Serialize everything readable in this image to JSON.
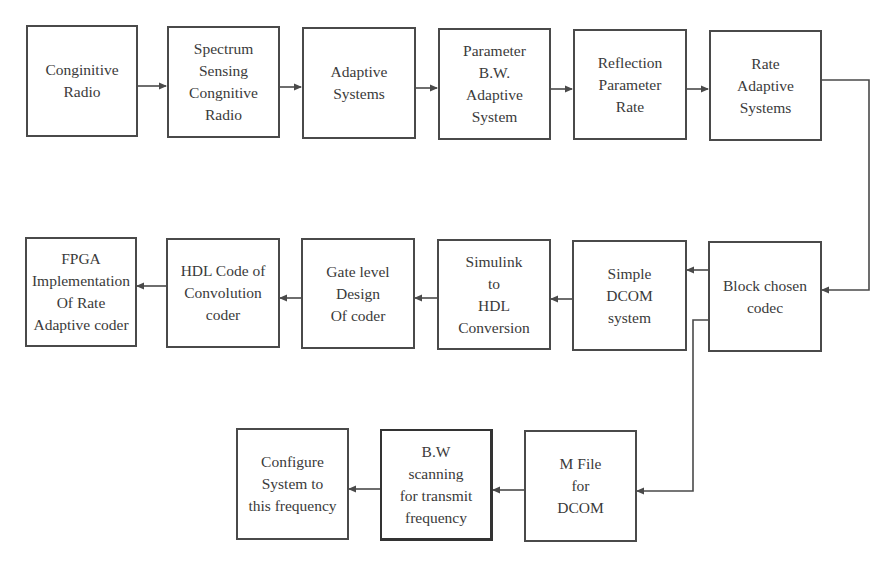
{
  "diagram": {
    "row1": [
      {
        "id": "cognitive-radio",
        "lines": [
          "Conginitive",
          "Radio"
        ]
      },
      {
        "id": "spectrum-sensing",
        "lines": [
          "Spectrum",
          "Sensing",
          "Congnitive",
          "Radio"
        ]
      },
      {
        "id": "adaptive-systems",
        "lines": [
          "Adaptive",
          "Systems"
        ]
      },
      {
        "id": "parameter-bw",
        "lines": [
          "Parameter",
          "B.W.",
          "Adaptive",
          "System"
        ]
      },
      {
        "id": "reflection-parameter",
        "lines": [
          "Reflection",
          "Parameter",
          "Rate"
        ]
      },
      {
        "id": "rate-adaptive",
        "lines": [
          "Rate",
          "Adaptive",
          "Systems"
        ]
      }
    ],
    "row2": [
      {
        "id": "fpga-implementation",
        "lines": [
          "FPGA",
          "Implementation",
          "Of Rate",
          "Adaptive coder"
        ]
      },
      {
        "id": "hdl-code",
        "lines": [
          "HDL Code of",
          "Convolution",
          "coder"
        ]
      },
      {
        "id": "gate-level",
        "lines": [
          "Gate level",
          "Design",
          "Of coder"
        ]
      },
      {
        "id": "simulink-hdl",
        "lines": [
          "Simulink",
          "to",
          "HDL",
          "Conversion"
        ]
      },
      {
        "id": "simple-dcom",
        "lines": [
          "Simple",
          "DCOM",
          "system"
        ]
      },
      {
        "id": "block-codec",
        "lines": [
          "Block chosen",
          "codec"
        ]
      }
    ],
    "row3": [
      {
        "id": "configure-system",
        "lines": [
          "Configure",
          "System to",
          "this frequency"
        ]
      },
      {
        "id": "bw-scanning",
        "lines": [
          "B.W",
          "scanning",
          "for transmit",
          "frequency"
        ]
      },
      {
        "id": "m-file",
        "lines": [
          "M File",
          "for",
          "DCOM"
        ]
      }
    ],
    "colors": {
      "line": "#4a4a4a",
      "text": "#3a3a3a",
      "background": "#ffffff"
    }
  }
}
